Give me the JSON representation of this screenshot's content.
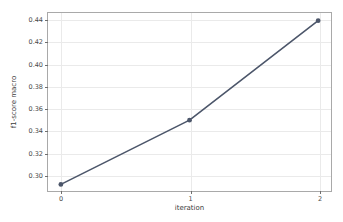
{
  "chart_data": {
    "type": "line",
    "title": "",
    "xlabel": "iteration",
    "ylabel": "f1-score macro",
    "x": [
      0,
      1,
      2
    ],
    "values": [
      0.2905,
      0.349,
      0.4395
    ],
    "series": [
      {
        "name": "f1-score macro",
        "values": [
          0.2905,
          0.349,
          0.4395
        ],
        "color": "#4c566a",
        "marker": "circle"
      }
    ],
    "xlim": [
      -0.1,
      2.1
    ],
    "ylim": [
      0.2845,
      0.4465
    ],
    "xticks": [
      0,
      1,
      2
    ],
    "xtick_labels": [
      "0",
      "1",
      "2"
    ],
    "yticks": [
      0.3,
      0.32,
      0.34,
      0.36,
      0.38,
      0.4,
      0.42,
      0.44
    ],
    "ytick_labels": [
      "0.30",
      "0.32",
      "0.34",
      "0.36",
      "0.38",
      "0.40",
      "0.42",
      "0.44"
    ],
    "grid": true,
    "grid_color": "#eaeaea",
    "legend": null,
    "background": "#ffffff",
    "axes_edge_color": "#a9a9a9"
  }
}
